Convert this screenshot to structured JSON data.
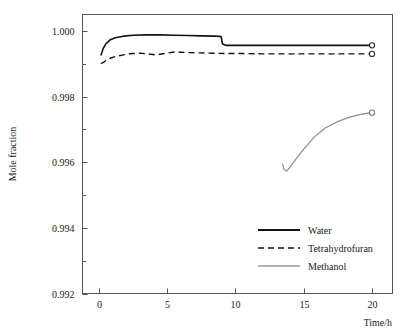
{
  "chart_data": {
    "type": "line",
    "title": "",
    "xlabel": "Time/h",
    "ylabel": "Mole fraction",
    "xlim": [
      -1.2,
      21.5
    ],
    "ylim": [
      0.992,
      1.0005
    ],
    "xticks": [
      0,
      5,
      10,
      15,
      20
    ],
    "xtick_labels": [
      "0",
      "5",
      "10",
      "15",
      "20"
    ],
    "yticks": [
      0.992,
      0.994,
      0.996,
      0.998,
      1.0
    ],
    "ytick_labels": [
      "0.992",
      "0.994",
      "0.996",
      "0.998",
      "1.000"
    ],
    "yminor_ticks": [
      0.993,
      0.995,
      0.997,
      0.999
    ],
    "grid": false,
    "legend_position": "lower right",
    "series": [
      {
        "name": "Water",
        "style": "solid",
        "color": "#111111",
        "endpoint_marker": "open-circle",
        "x": [
          0.15,
          0.3,
          0.5,
          0.8,
          1.2,
          1.8,
          2.5,
          3.5,
          4.5,
          5.5,
          6.5,
          7.5,
          8.5,
          8.95,
          9.05,
          9.3,
          10.0,
          12.0,
          14.0,
          16.0,
          18.0,
          20.0
        ],
        "y": [
          0.99925,
          0.99945,
          0.9996,
          0.99972,
          0.99979,
          0.99984,
          0.99987,
          0.99988,
          0.99988,
          0.99987,
          0.99986,
          0.99985,
          0.99984,
          0.99983,
          0.9996,
          0.99956,
          0.99956,
          0.99956,
          0.99956,
          0.99956,
          0.99956,
          0.99956
        ]
      },
      {
        "name": "Tetrahydrofuran",
        "style": "dashed",
        "color": "#111111",
        "endpoint_marker": "open-circle",
        "x": [
          0.15,
          0.35,
          0.7,
          1.2,
          1.8,
          2.4,
          3.0,
          3.6,
          4.2,
          4.8,
          5.2,
          5.6,
          6.0,
          6.6,
          7.4,
          8.4,
          9.4,
          10.5,
          12.0,
          14.0,
          16.0,
          18.0,
          20.0
        ],
        "y": [
          0.999,
          0.99905,
          0.99915,
          0.99922,
          0.99927,
          0.99931,
          0.99932,
          0.9993,
          0.99927,
          0.99931,
          0.99934,
          0.99936,
          0.99935,
          0.99934,
          0.99933,
          0.99932,
          0.99931,
          0.99931,
          0.9993,
          0.9993,
          0.9993,
          0.9993,
          0.9993
        ]
      },
      {
        "name": "Methanol",
        "style": "solid-thin",
        "color": "#8d8d8d",
        "endpoint_marker": "open-circle",
        "x": [
          13.45,
          13.55,
          13.75,
          14.0,
          14.4,
          15.0,
          15.8,
          16.6,
          17.4,
          18.2,
          19.0,
          19.6,
          20.0
        ],
        "y": [
          0.99595,
          0.99578,
          0.99573,
          0.99585,
          0.99608,
          0.9964,
          0.99678,
          0.99705,
          0.99722,
          0.99735,
          0.99744,
          0.99749,
          0.99751
        ]
      }
    ],
    "legend_entries": [
      {
        "label": "Water",
        "style": "solid"
      },
      {
        "label": "Tetrahydrofuran",
        "style": "dashed"
      },
      {
        "label": "Methanol",
        "style": "solid-thin"
      }
    ]
  }
}
